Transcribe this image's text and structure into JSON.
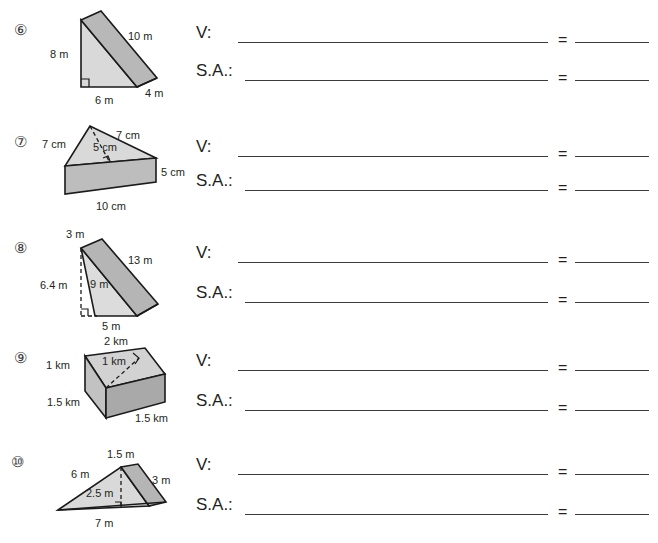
{
  "worksheet": {
    "answer_labels": {
      "volume": "V:",
      "surface_area": "S.A.:",
      "equals": "="
    }
  },
  "problems": [
    {
      "number": "6",
      "number_glyph": "⑥",
      "shape": "triangular-prism-right-triangle-upright",
      "unit": "m",
      "labels": {
        "height": "8 m",
        "hypotenuse": "10 m",
        "base": "6 m",
        "depth": "4 m"
      }
    },
    {
      "number": "7",
      "number_glyph": "⑦",
      "shape": "triangular-prism-isosceles-top",
      "unit": "cm",
      "labels": {
        "left_side": "7 cm",
        "right_side": "7 cm",
        "altitude": "5 cm",
        "prism_height": "5 cm",
        "base": "10 cm"
      }
    },
    {
      "number": "8",
      "number_glyph": "⑧",
      "shape": "triangular-prism-obtuse-external-altitude",
      "unit": "m",
      "labels": {
        "top": "3 m",
        "slant": "13 m",
        "altitude": "6.4 m",
        "side": "9 m",
        "base": "5 m"
      }
    },
    {
      "number": "9",
      "number_glyph": "⑨",
      "shape": "triangular-prism-3d-box",
      "unit": "km",
      "labels": {
        "left_edge": "1 km",
        "top_edge": "2 km",
        "altitude": "1 km",
        "front_left": "1.5 km",
        "front_bottom": "1.5 km"
      }
    },
    {
      "number": "10",
      "number_glyph": "⑩",
      "shape": "triangular-prism-flat-wedge",
      "unit": "m",
      "labels": {
        "top": "1.5 m",
        "slant": "6 m",
        "altitude": "2.5 m",
        "right_side": "3 m",
        "base": "7 m"
      }
    }
  ],
  "colors": {
    "face_light": "#d9d9d9",
    "face_mid": "#c6c6c6",
    "face_dark": "#b0b0b0",
    "outline": "#1a1a1a",
    "rule": "#3a3a3a",
    "text": "#231f20"
  }
}
